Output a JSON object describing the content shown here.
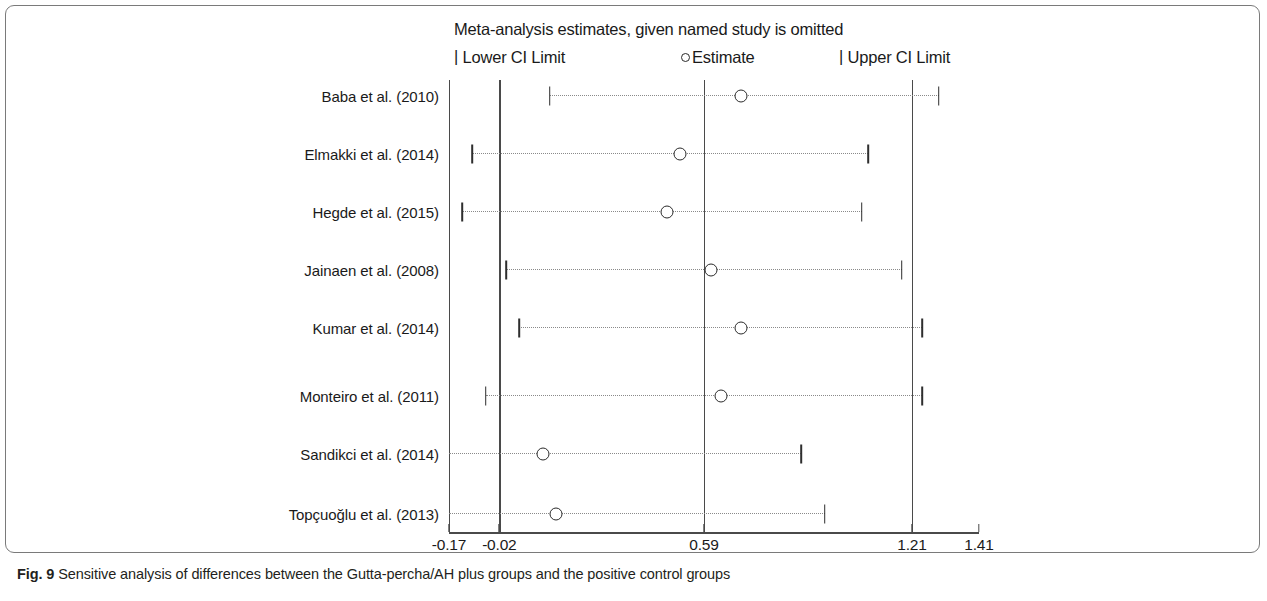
{
  "figure": {
    "caption_label": "Fig. 9",
    "caption_text": "Sensitive analysis of differences between the Gutta-percha/AH plus groups and the positive control groups"
  },
  "chart_data": {
    "type": "scatter",
    "title": "Meta-analysis estimates, given named study is omitted",
    "xlabel": "",
    "ylabel": "",
    "xlim": [
      -0.17,
      1.41
    ],
    "grid": false,
    "legend_position": "top",
    "legend": [
      {
        "key": "lower_ci",
        "glyph": "|",
        "label": "Lower CI Limit"
      },
      {
        "key": "estimate",
        "glyph": "o",
        "label": "Estimate"
      },
      {
        "key": "upper_ci",
        "glyph": "|",
        "label": "Upper CI Limit"
      }
    ],
    "x_ticks": [
      -0.17,
      -0.02,
      0.59,
      1.21,
      1.41
    ],
    "x_tick_labels": [
      "-0.17",
      "-0.02",
      "0.59",
      "1.21",
      "1.41"
    ],
    "reference_lines": [
      -0.17,
      -0.02,
      0.59,
      1.21
    ],
    "categories": [
      "Baba et al. (2010)",
      "Elmakki et al. (2014)",
      "Hegde et al. (2015)",
      "Jainaen et al.  (2008)",
      "Kumar et al.  (2014)",
      "Monteiro et al. (2011)",
      "Sandikci et al. (2014)",
      "Topçuoğlu et al. (2013)"
    ],
    "series": [
      {
        "name": "Lower CI Limit",
        "values": [
          0.13,
          -0.1,
          -0.13,
          0.0,
          0.04,
          -0.06,
          -0.17,
          -0.17
        ],
        "clipped_at_left": [
          false,
          false,
          false,
          false,
          false,
          false,
          true,
          true
        ]
      },
      {
        "name": "Estimate",
        "values": [
          0.7,
          0.52,
          0.48,
          0.61,
          0.7,
          0.64,
          0.11,
          0.15
        ]
      },
      {
        "name": "Upper CI Limit",
        "values": [
          1.29,
          1.08,
          1.06,
          1.18,
          1.24,
          1.24,
          0.88,
          0.95
        ]
      }
    ]
  }
}
